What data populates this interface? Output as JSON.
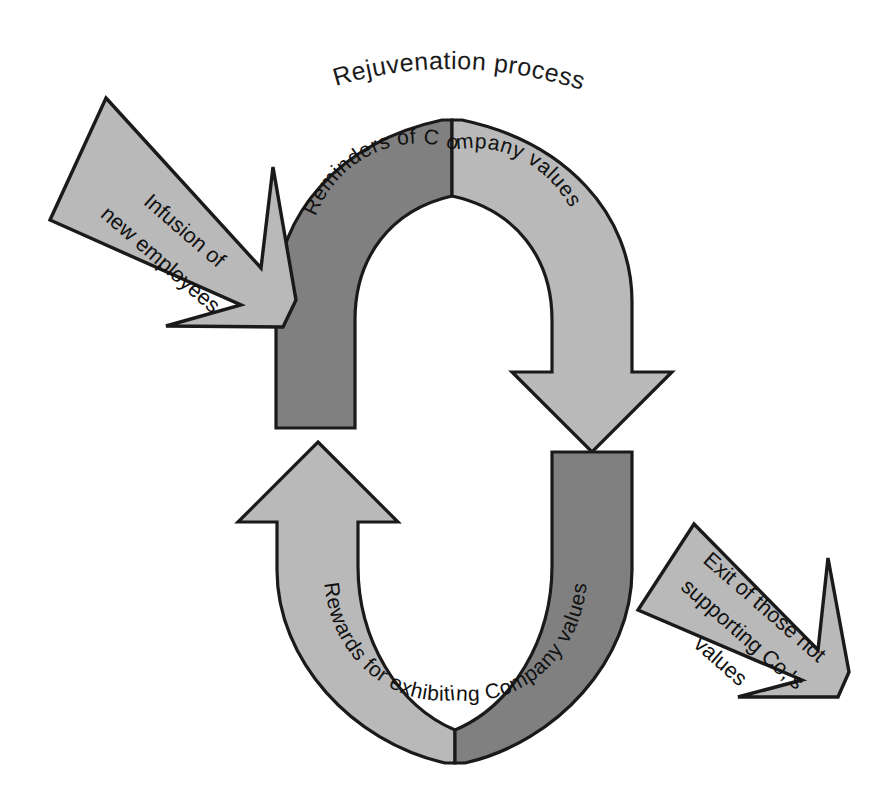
{
  "diagram": {
    "title": "Rejuvenation process",
    "type": "cycle-diagram",
    "background_color": "#ffffff",
    "colors": {
      "band_dark": "#808080",
      "band_light": "#b9b9b9",
      "callout_fill": "#b9b9b9",
      "outline": "#1a1a1a",
      "text": "#111111"
    },
    "ring": {
      "upper": {
        "name": "upper-arc",
        "label": "Reminders of C ompany values",
        "left_band_color": "#808080",
        "right_band_color": "#b9b9b9",
        "arrow_direction": "down",
        "arrow_side": "right"
      },
      "lower": {
        "name": "lower-arc",
        "label": "Rewards for exhibiting Company values",
        "left_band_color": "#b9b9b9",
        "right_band_color": "#808080",
        "arrow_direction": "up",
        "arrow_side": "left"
      }
    },
    "callouts": [
      {
        "name": "infusion-callout",
        "lines": [
          "Infusion of",
          "new employees"
        ],
        "direction": "down-right",
        "position": "upper-left"
      },
      {
        "name": "exit-callout",
        "lines": [
          "Exit of those not",
          "supporting Co,'s",
          "values"
        ],
        "direction": "down-right",
        "position": "lower-right"
      }
    ]
  }
}
